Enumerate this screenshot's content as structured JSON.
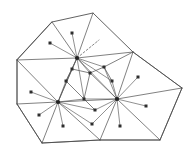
{
  "figure": {
    "type": "geometric-diagram",
    "background_color": "#ffffff",
    "line_color": "#3a3a3a",
    "node_color": "#2e2e2e",
    "width": 189,
    "height": 153
  },
  "chart_data": {
    "type": "diagram",
    "boundary_polygon": [
      {
        "name": "boundary-top-left",
        "x": 52,
        "y": 22
      },
      {
        "name": "boundary-top-right",
        "x": 93,
        "y": 13
      },
      {
        "name": "boundary-right-upper",
        "x": 133,
        "y": 52
      },
      {
        "name": "boundary-right",
        "x": 182,
        "y": 88
      },
      {
        "name": "boundary-bottom-right",
        "x": 160,
        "y": 140
      },
      {
        "name": "boundary-bottom-mid",
        "x": 100,
        "y": 140
      },
      {
        "name": "boundary-bottom-left",
        "x": 42,
        "y": 143
      },
      {
        "name": "boundary-left-lower",
        "x": 17,
        "y": 104
      },
      {
        "name": "boundary-left-upper",
        "x": 17,
        "y": 60
      }
    ],
    "hubs": [
      {
        "name": "hub-top",
        "x": 77,
        "y": 58,
        "degree": 14
      },
      {
        "name": "hub-left",
        "x": 58,
        "y": 102,
        "degree": 13
      },
      {
        "name": "hub-right",
        "x": 117,
        "y": 99,
        "degree": 13
      }
    ],
    "interior_nodes": [
      {
        "name": "node-a",
        "x": 72,
        "y": 69
      },
      {
        "name": "node-b",
        "x": 90,
        "y": 73
      },
      {
        "name": "node-c",
        "x": 104,
        "y": 67
      },
      {
        "name": "node-d",
        "x": 84,
        "y": 99
      },
      {
        "name": "node-e",
        "x": 95,
        "y": 110
      },
      {
        "name": "node-f",
        "x": 66,
        "y": 81
      },
      {
        "name": "node-g",
        "x": 112,
        "y": 81
      }
    ],
    "leaf_nodes": [
      {
        "name": "leaf-top-spoke",
        "x": 72,
        "y": 33
      },
      {
        "name": "leaf-upper-left",
        "x": 50,
        "y": 43
      },
      {
        "name": "leaf-left-upper",
        "x": 31,
        "y": 92
      },
      {
        "name": "leaf-left-lower",
        "x": 39,
        "y": 115
      },
      {
        "name": "leaf-bottom-left",
        "x": 63,
        "y": 126
      },
      {
        "name": "leaf-bottom-mid",
        "x": 92,
        "y": 124
      },
      {
        "name": "leaf-right-upper",
        "x": 138,
        "y": 77
      },
      {
        "name": "leaf-right-mid",
        "x": 146,
        "y": 106
      },
      {
        "name": "leaf-bottom-right",
        "x": 120,
        "y": 126
      }
    ],
    "dashed_edge": {
      "name": "dashed-spoke",
      "from": {
        "x": 77,
        "y": 58
      },
      "to": {
        "x": 99,
        "y": 40
      },
      "style": "dashed"
    },
    "edge_count_total": 58,
    "node_count_total": 28,
    "legend": [],
    "annotations": []
  }
}
